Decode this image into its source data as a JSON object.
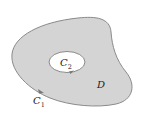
{
  "diagram": {
    "region_label": "D",
    "outer_curve": {
      "label": "C",
      "subscript": "1"
    },
    "inner_curve": {
      "label": "C",
      "subscript": "2"
    },
    "colors": {
      "region_fill": "#d4d4d4",
      "curve_stroke": "#8a8a8a",
      "hole_fill": "#ffffff",
      "label": "#222222"
    }
  }
}
